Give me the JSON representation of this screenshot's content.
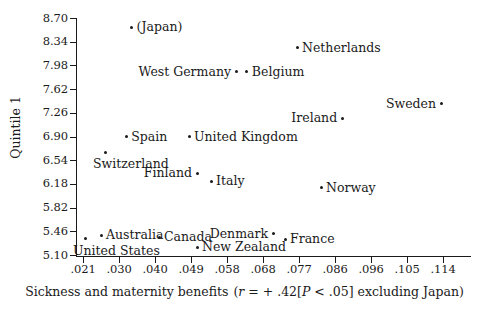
{
  "chart_data": {
    "type": "scatter",
    "title": "",
    "xlabel": "Sickness and maternity benefits",
    "xlabel_stat": "(r = + .42[P < .05] excluding Japan)",
    "ylabel": "Quintile 1",
    "xlim": [
      0.021,
      0.114
    ],
    "ylim": [
      5.1,
      8.7
    ],
    "grid": false,
    "legend": "none",
    "xticks": [
      ".021",
      ".030",
      ".040",
      ".049",
      ".058",
      ".068",
      ".077",
      ".086",
      ".096",
      ".105",
      ".114"
    ],
    "xtick_values": [
      0.021,
      0.03,
      0.04,
      0.049,
      0.058,
      0.068,
      0.077,
      0.086,
      0.096,
      0.105,
      0.114
    ],
    "yticks": [
      "8.70",
      "8.34",
      "7.98",
      "7.62",
      "7.26",
      "6.90",
      "6.54",
      "6.18",
      "5.82",
      "5.46",
      "5.10"
    ],
    "ytick_values": [
      8.7,
      8.34,
      7.98,
      7.62,
      7.26,
      6.9,
      6.54,
      6.18,
      5.82,
      5.46,
      5.1
    ],
    "points": [
      {
        "label": "(Japan)",
        "x": 0.0335,
        "y": 8.56,
        "label_pos": "right"
      },
      {
        "label": "Netherlands",
        "x": 0.0765,
        "y": 8.25,
        "label_pos": "right"
      },
      {
        "label": "West Germany",
        "x": 0.0605,
        "y": 7.88,
        "label_pos": "left"
      },
      {
        "label": "Belgium",
        "x": 0.0635,
        "y": 7.88,
        "label_pos": "right"
      },
      {
        "label": "Sweden",
        "x": 0.1135,
        "y": 7.4,
        "label_pos": "left"
      },
      {
        "label": "Ireland",
        "x": 0.088,
        "y": 7.18,
        "label_pos": "left"
      },
      {
        "label": "United Kingdom",
        "x": 0.0485,
        "y": 6.9,
        "label_pos": "right"
      },
      {
        "label": "Spain",
        "x": 0.032,
        "y": 6.9,
        "label_pos": "right"
      },
      {
        "label": "Switzerland",
        "x": 0.0265,
        "y": 6.66,
        "label_pos": "below"
      },
      {
        "label": "Finland",
        "x": 0.0505,
        "y": 6.34,
        "label_pos": "left"
      },
      {
        "label": "Italy",
        "x": 0.054,
        "y": 6.22,
        "label_pos": "right"
      },
      {
        "label": "Norway",
        "x": 0.0825,
        "y": 6.12,
        "label_pos": "right"
      },
      {
        "label": "Australia",
        "x": 0.0255,
        "y": 5.4,
        "label_pos": "right"
      },
      {
        "label": "Denmark",
        "x": 0.0705,
        "y": 5.42,
        "label_pos": "left"
      },
      {
        "label": "France",
        "x": 0.0735,
        "y": 5.34,
        "label_pos": "right"
      },
      {
        "label": "Canada",
        "x": 0.041,
        "y": 5.37,
        "label_pos": "right"
      },
      {
        "label": "United States",
        "x": 0.0215,
        "y": 5.35,
        "label_pos": "below"
      },
      {
        "label": "New Zealand",
        "x": 0.0505,
        "y": 5.22,
        "label_pos": "right"
      }
    ]
  }
}
